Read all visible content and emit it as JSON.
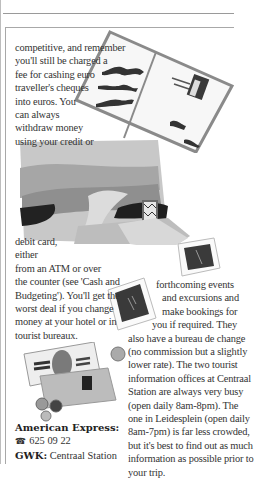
{
  "page": {
    "paragraph_left_top": [
      "competitive, and remember",
      "you'll still be charged a",
      "fee for cashing euro",
      "traveller's cheques",
      "into euros. You",
      "can always",
      "withdraw money",
      "using your credit or"
    ],
    "paragraph_left_bottom": [
      "debit card,",
      "either",
      "from an ATM or over",
      "the counter (see 'Cash and",
      "Budgeting'). You'll get the",
      "worst deal if you change",
      "money at your hotel or in",
      "tourist bureaux."
    ],
    "paragraph_right": [
      "forthcoming events",
      "and excursions and",
      "make bookings for",
      "you if required. They",
      "also have a bureau de change",
      "(no commission but a slightly",
      "lower rate). The two tourist",
      "information offices at Centraal",
      "Station are always very busy",
      "(open daily 8am-8pm). The",
      "one in Leidesplein (open daily",
      "8am-7pm) is far less crowded,",
      "but it's best to find out as much",
      "information as possible prior to",
      "your trip."
    ],
    "contacts": [
      {
        "label": "American Express:",
        "value": ""
      },
      {
        "icon": "telephone-icon",
        "glyph": "☎",
        "value": "625 09 22"
      },
      {
        "label": "GWK:",
        "value": "Centraal Station"
      }
    ],
    "illustrations": [
      "postcard-illustration",
      "landscape-collage-illustration",
      "photo-snapshot-illustration",
      "photo-snapshot-illustration-2",
      "banknotes-and-coins-illustration"
    ]
  }
}
